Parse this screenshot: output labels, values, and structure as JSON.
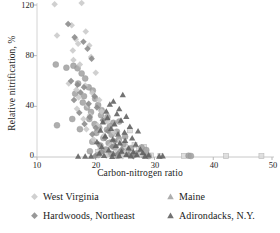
{
  "chart_data": {
    "type": "scatter",
    "title": "",
    "xlabel": "Carbon-nitrogen ratio",
    "ylabel": "Relative nitrification, %",
    "xlim": [
      10,
      50
    ],
    "ylim": [
      0,
      120
    ],
    "xticks": [
      10,
      20,
      30,
      40,
      50
    ],
    "yticks": [
      0,
      40,
      80,
      120
    ],
    "grid": false,
    "legend_position": "bottom",
    "series": [
      {
        "name": "West Virginia",
        "marker": "diamond",
        "color": "#c9c9c9",
        "points": [
          [
            13.0,
            120.5
          ],
          [
            17.6,
            121.5
          ],
          [
            15.9,
            104.0
          ],
          [
            13.4,
            96.0
          ],
          [
            16.6,
            93.0
          ],
          [
            17.0,
            89.5
          ],
          [
            18.3,
            99.0
          ],
          [
            18.9,
            88.0
          ],
          [
            16.1,
            84.0
          ],
          [
            19.2,
            79.0
          ],
          [
            16.2,
            76.5
          ],
          [
            17.3,
            73.0
          ],
          [
            20.0,
            66.5
          ],
          [
            15.4,
            58.0
          ],
          [
            18.2,
            56.5
          ],
          [
            16.7,
            53.0
          ],
          [
            19.4,
            50.5
          ],
          [
            17.1,
            47.0
          ],
          [
            20.6,
            45.0
          ],
          [
            18.6,
            41.0
          ],
          [
            16.8,
            38.0
          ],
          [
            21.0,
            36.0
          ],
          [
            19.0,
            33.0
          ],
          [
            17.9,
            30.0
          ],
          [
            22.0,
            28.0
          ],
          [
            20.3,
            25.0
          ],
          [
            18.4,
            22.0
          ],
          [
            23.0,
            20.0
          ],
          [
            21.4,
            17.0
          ],
          [
            19.6,
            14.0
          ],
          [
            24.0,
            12.0
          ],
          [
            22.5,
            9.0
          ],
          [
            20.8,
            6.5
          ],
          [
            25.0,
            5.0
          ],
          [
            23.4,
            3.0
          ],
          [
            26.0,
            2.0
          ],
          [
            21.8,
            1.0
          ],
          [
            27.5,
            1.5
          ],
          [
            24.6,
            0.5
          ]
        ]
      },
      {
        "name": "Hardwoods, Northeast",
        "marker": "diamond",
        "color": "#8a8a8a",
        "points": [
          [
            15.3,
            105.0
          ],
          [
            16.4,
            94.5
          ],
          [
            17.9,
            91.0
          ],
          [
            18.6,
            85.5
          ],
          [
            19.3,
            77.5
          ],
          [
            15.8,
            60.0
          ],
          [
            16.9,
            57.0
          ],
          [
            18.0,
            55.0
          ],
          [
            17.4,
            51.0
          ],
          [
            19.8,
            48.0
          ],
          [
            16.3,
            45.0
          ],
          [
            18.8,
            42.0
          ],
          [
            20.2,
            39.0
          ],
          [
            17.2,
            35.0
          ],
          [
            19.0,
            31.5
          ],
          [
            21.2,
            29.0
          ],
          [
            18.1,
            26.0
          ],
          [
            20.0,
            23.0
          ],
          [
            22.1,
            20.5
          ],
          [
            19.4,
            18.0
          ],
          [
            21.6,
            15.0
          ],
          [
            23.2,
            12.5
          ],
          [
            20.5,
            10.0
          ],
          [
            22.8,
            8.0
          ],
          [
            24.4,
            6.0
          ],
          [
            21.0,
            4.0
          ],
          [
            23.8,
            2.5
          ],
          [
            25.6,
            1.5
          ],
          [
            19.9,
            0.8
          ],
          [
            26.4,
            0.6
          ]
        ]
      },
      {
        "name": "Maine",
        "marker": "circle",
        "color": "#a3a3a3",
        "points": [
          [
            13.2,
            73.0
          ],
          [
            15.0,
            70.5
          ],
          [
            16.2,
            72.0
          ],
          [
            16.9,
            70.0
          ],
          [
            17.6,
            66.0
          ],
          [
            18.2,
            62.0
          ],
          [
            17.0,
            58.0
          ],
          [
            18.8,
            55.0
          ],
          [
            19.5,
            52.5
          ],
          [
            16.5,
            50.0
          ],
          [
            18.0,
            48.0
          ],
          [
            19.9,
            46.0
          ],
          [
            17.8,
            43.0
          ],
          [
            20.4,
            41.0
          ],
          [
            18.5,
            39.0
          ],
          [
            21.0,
            37.0
          ],
          [
            19.2,
            35.5
          ],
          [
            20.9,
            33.0
          ],
          [
            22.0,
            31.5
          ],
          [
            18.9,
            30.0
          ],
          [
            21.5,
            28.5
          ],
          [
            23.0,
            27.0
          ],
          [
            19.8,
            26.0
          ],
          [
            22.4,
            24.5
          ],
          [
            20.6,
            23.0
          ],
          [
            24.0,
            28.0
          ],
          [
            21.9,
            21.5
          ],
          [
            23.6,
            20.0
          ],
          [
            20.1,
            19.0
          ],
          [
            22.7,
            17.5
          ],
          [
            25.0,
            16.0
          ],
          [
            21.3,
            15.0
          ],
          [
            23.9,
            13.5
          ],
          [
            19.4,
            12.0
          ],
          [
            22.2,
            11.0
          ],
          [
            24.7,
            10.0
          ],
          [
            20.8,
            9.0
          ],
          [
            23.3,
            8.0
          ],
          [
            26.0,
            7.0
          ],
          [
            21.7,
            6.0
          ],
          [
            25.4,
            5.0
          ],
          [
            19.0,
            4.5
          ],
          [
            24.2,
            3.5
          ],
          [
            27.0,
            3.0
          ],
          [
            22.6,
            2.5
          ],
          [
            26.7,
            2.0
          ],
          [
            20.4,
            1.5
          ],
          [
            28.2,
            1.2
          ],
          [
            23.7,
            1.0
          ],
          [
            29.0,
            0.8
          ],
          [
            13.4,
            25.0
          ],
          [
            16.0,
            30.0
          ],
          [
            17.3,
            22.0
          ],
          [
            35.8,
            1.0
          ],
          [
            27.8,
            7.5
          ],
          [
            28.6,
            5.5
          ],
          [
            36.2,
            0.8
          ]
        ]
      },
      {
        "name": "Adirondacks, N.Y.",
        "marker": "triangle",
        "color": "#5e5e5e",
        "points": [
          [
            24.6,
            49.0
          ],
          [
            23.0,
            44.0
          ],
          [
            22.4,
            41.5
          ],
          [
            24.0,
            38.0
          ],
          [
            21.8,
            36.0
          ],
          [
            23.6,
            34.0
          ],
          [
            25.2,
            32.0
          ],
          [
            22.0,
            31.0
          ],
          [
            24.3,
            29.0
          ],
          [
            21.2,
            27.5
          ],
          [
            23.2,
            26.0
          ],
          [
            25.8,
            24.0
          ],
          [
            22.6,
            22.5
          ],
          [
            20.8,
            21.0
          ],
          [
            24.9,
            19.5
          ],
          [
            23.8,
            18.0
          ],
          [
            27.2,
            20.5
          ],
          [
            21.6,
            16.5
          ],
          [
            26.2,
            15.0
          ],
          [
            22.9,
            14.0
          ],
          [
            25.0,
            13.0
          ],
          [
            20.2,
            12.0
          ],
          [
            24.1,
            11.0
          ],
          [
            26.8,
            10.0
          ],
          [
            23.4,
            9.0
          ],
          [
            21.0,
            8.0
          ],
          [
            25.6,
            7.0
          ],
          [
            27.6,
            6.0
          ],
          [
            22.2,
            5.5
          ],
          [
            24.4,
            4.5
          ],
          [
            26.4,
            4.0
          ],
          [
            28.0,
            3.5
          ],
          [
            20.6,
            3.0
          ],
          [
            23.0,
            2.5
          ],
          [
            25.2,
            2.0
          ],
          [
            27.0,
            1.8
          ],
          [
            29.0,
            1.5
          ],
          [
            21.4,
            1.2
          ],
          [
            24.0,
            1.0
          ],
          [
            26.0,
            0.8
          ],
          [
            28.4,
            0.6
          ],
          [
            30.8,
            0.6
          ],
          [
            31.4,
            0.8
          ],
          [
            17.0,
            0.5
          ],
          [
            18.2,
            0.5
          ],
          [
            19.2,
            0.6
          ],
          [
            22.8,
            0.4
          ]
        ]
      },
      {
        "name": "square-series",
        "marker": "square",
        "color": "#dcdcdc",
        "points": [
          [
            25.8,
            21.0
          ],
          [
            24.0,
            13.5
          ],
          [
            22.8,
            12.0
          ],
          [
            26.6,
            9.5
          ],
          [
            25.0,
            8.5
          ],
          [
            23.4,
            7.0
          ],
          [
            27.4,
            6.5
          ],
          [
            21.9,
            5.5
          ],
          [
            24.6,
            4.5
          ],
          [
            26.0,
            3.5
          ],
          [
            28.6,
            3.0
          ],
          [
            22.4,
            2.5
          ],
          [
            25.4,
            2.0
          ],
          [
            27.8,
            1.5
          ],
          [
            29.4,
            1.2
          ],
          [
            23.8,
            1.0
          ],
          [
            31.0,
            0.8
          ],
          [
            35.0,
            0.9
          ],
          [
            42.2,
            0.7
          ],
          [
            48.2,
            0.7
          ],
          [
            28.2,
            8.0
          ],
          [
            20.4,
            4.0
          ]
        ]
      }
    ]
  },
  "axis": {
    "x_ticks": [
      "10",
      "20",
      "30",
      "40",
      "50"
    ],
    "y_ticks": [
      "0",
      "40",
      "80",
      "120"
    ],
    "x_title": "Carbon-nitrogen ratio",
    "y_title": "Relative nitrification, %"
  },
  "legend": {
    "items": [
      {
        "label": "West Virginia",
        "marker": "diamond",
        "color": "#c9c9c9"
      },
      {
        "label": "Maine",
        "marker": "triangle",
        "color": "#a3a3a3"
      },
      {
        "label": "Hardwoods, Northeast",
        "marker": "diamond",
        "color": "#8a8a8a"
      },
      {
        "label": "Adirondacks, N.Y.",
        "marker": "triangle",
        "color": "#5e5e5e"
      }
    ]
  }
}
